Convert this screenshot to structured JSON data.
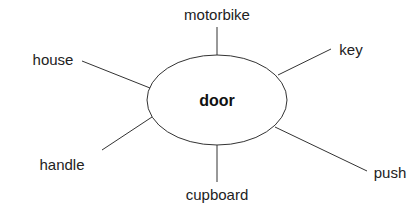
{
  "diagram": {
    "type": "spider-diagram",
    "center": {
      "label": "door",
      "x": 217,
      "y": 101
    },
    "nodes": [
      {
        "label": "motorbike",
        "x": 217,
        "y": 13
      },
      {
        "label": "key",
        "x": 350,
        "y": 50
      },
      {
        "label": "house",
        "x": 54,
        "y": 59
      },
      {
        "label": "handle",
        "x": 61,
        "y": 164
      },
      {
        "label": "cupboard",
        "x": 217,
        "y": 195
      },
      {
        "label": "push",
        "x": 396,
        "y": 172
      }
    ]
  }
}
